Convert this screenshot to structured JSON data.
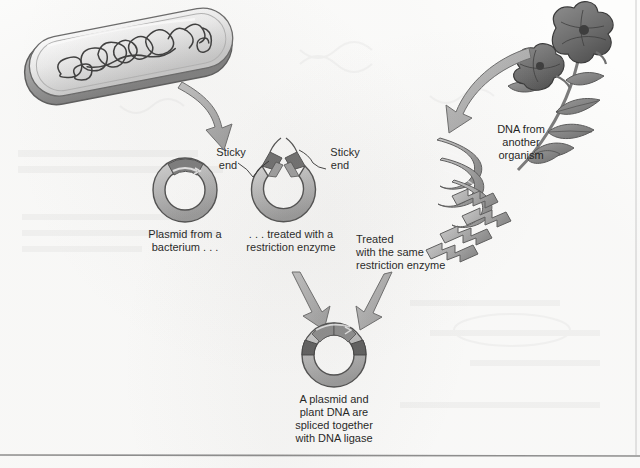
{
  "figure": {
    "background_color": "#fdfdfc",
    "ink_color": "#1d1d1d",
    "fill_light": "#cfcfcf",
    "fill_mid": "#a8a8a8",
    "fill_dark": "#6e6e6e",
    "arrow_fill": "#b0b0b0",
    "border_color": "#8e8e8e"
  },
  "labels": {
    "plasmid_source": {
      "line1": "Plasmid from a",
      "line2": "bacterium . . ."
    },
    "cut_plasmid": {
      "line1": ". . . treated with a",
      "line2": "restriction enzyme"
    },
    "sticky_end_left": {
      "line1": "Sticky",
      "line2": "end"
    },
    "sticky_end_right": {
      "line1": "Sticky",
      "line2": "end"
    },
    "foreign_dna": {
      "line1": "DNA from",
      "line2": "another",
      "line3": "organism"
    },
    "treated_same_enzyme": {
      "line1": "Treated",
      "line2": "with the same",
      "line3": "restriction enzyme"
    },
    "recombinant_plasmid": {
      "line1": "A plasmid and",
      "line2": "plant DNA are",
      "line3": "spliced together",
      "line4": "with DNA ligase"
    }
  },
  "elements": {
    "bacterium": "bacterial-cell-with-chromosome",
    "plasmid_intact": "circular-plasmid",
    "plasmid_cut": "linearized-open-plasmid",
    "plant": "petunia-plant-with-two-flowers",
    "dna_helix": "dna-double-helix-ribbon",
    "dna_fragments": "cut-dna-fragments-sticky-ends",
    "plasmid_recombinant": "recombinant-plasmid"
  }
}
